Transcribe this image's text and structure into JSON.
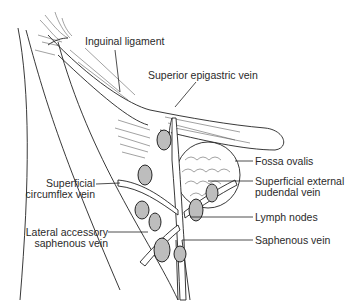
{
  "diagram": {
    "labels": {
      "inguinal_ligament": "Inguinal ligament",
      "superior_epigastric_vein": "Superior epigastric vein",
      "fossa_ovalis": "Fossa ovalis",
      "superficial_circumflex_vein_line1": "Superficial",
      "superficial_circumflex_vein_line2": "circumflex vein",
      "superficial_external_pudendal_vein_line1": "Superficial external",
      "superficial_external_pudendal_vein_line2": "pudendal vein",
      "lymph_nodes": "Lymph nodes",
      "lateral_accessory_saphenous_vein_line1": "Lateral accessory",
      "lateral_accessory_saphenous_vein_line2": "saphenous vein",
      "saphenous_vein": "Saphenous vein"
    },
    "colors": {
      "line": "#222222",
      "node_fill": "#bdbdbd",
      "background": "#ffffff"
    }
  }
}
